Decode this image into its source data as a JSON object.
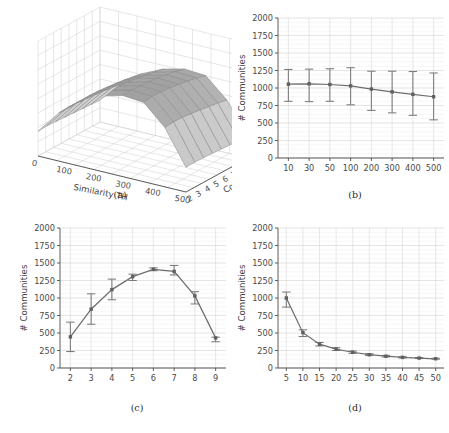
{
  "figure": {
    "background": "#ffffff",
    "line_color": "#6e6e6e",
    "grid_color": "#d9d9d9",
    "captions": {
      "a": "(a)",
      "b": "(b)",
      "c": "(c)",
      "d": "(d)"
    }
  },
  "chart_data": [
    {
      "id": "a",
      "type": "surface",
      "title": "",
      "caption": "(a)",
      "xlabel": "Similarity TH",
      "ylabel": "Content TH",
      "zlabel": "",
      "xticks": [
        0,
        100,
        200,
        300,
        400,
        500
      ],
      "yticks": [
        2,
        3,
        4,
        5,
        6,
        7,
        8,
        9
      ],
      "zticks": [
        0,
        250,
        500,
        750,
        1000,
        1250,
        1500,
        1750,
        2000
      ],
      "xlim": [
        0,
        500
      ],
      "ylim": [
        2,
        9
      ],
      "zlim": [
        0,
        2000
      ],
      "grid": true,
      "colormap": "greys",
      "z_matrix": [
        [
          430,
          440,
          430,
          420,
          410,
          400,
          390,
          380
        ],
        [
          840,
          850,
          845,
          830,
          815,
          800,
          780,
          760
        ],
        [
          1120,
          1140,
          1135,
          1120,
          1100,
          1080,
          1050,
          1020
        ],
        [
          1310,
          1330,
          1320,
          1300,
          1280,
          1250,
          1220,
          1190
        ],
        [
          1410,
          1420,
          1415,
          1400,
          1380,
          1350,
          1320,
          1280
        ],
        [
          1380,
          1400,
          1395,
          1380,
          1355,
          1330,
          1295,
          1255
        ],
        [
          1030,
          1045,
          1040,
          1020,
          1000,
          975,
          950,
          920
        ],
        [
          430,
          435,
          430,
          420,
          410,
          400,
          390,
          380
        ]
      ]
    },
    {
      "id": "b",
      "type": "line",
      "caption": "(b)",
      "xlabel": "",
      "ylabel": "# Communities",
      "categories": [
        "10",
        "30",
        "50",
        "100",
        "200",
        "300",
        "400",
        "500"
      ],
      "values": [
        1055,
        1060,
        1050,
        1030,
        985,
        945,
        910,
        875
      ],
      "err_low": [
        810,
        805,
        810,
        760,
        680,
        645,
        610,
        545
      ],
      "err_high": [
        1265,
        1270,
        1275,
        1290,
        1240,
        1240,
        1235,
        1215
      ],
      "yticks": [
        0,
        250,
        500,
        750,
        1000,
        1250,
        1500,
        1750,
        2000
      ],
      "ylim": [
        0,
        2000
      ],
      "grid": true
    },
    {
      "id": "c",
      "type": "line",
      "caption": "(c)",
      "xlabel": "",
      "ylabel": "# Communities",
      "categories": [
        "2",
        "3",
        "4",
        "5",
        "6",
        "7",
        "8",
        "9"
      ],
      "values": [
        445,
        840,
        1120,
        1305,
        1410,
        1380,
        1030,
        430
      ],
      "err_low": [
        235,
        625,
        975,
        1250,
        1390,
        1330,
        915,
        375
      ],
      "err_high": [
        655,
        1060,
        1270,
        1340,
        1430,
        1465,
        1090,
        440
      ],
      "yticks": [
        0,
        250,
        500,
        750,
        1000,
        1250,
        1500,
        1750,
        2000
      ],
      "ylim": [
        0,
        2000
      ],
      "grid": true
    },
    {
      "id": "d",
      "type": "line",
      "caption": "(d)",
      "xlabel": "",
      "ylabel": "# Communities",
      "categories": [
        "5",
        "10",
        "15",
        "20",
        "25",
        "30",
        "35",
        "40",
        "45",
        "50"
      ],
      "values": [
        1000,
        505,
        340,
        270,
        225,
        190,
        168,
        152,
        142,
        132
      ],
      "err_low": [
        870,
        450,
        315,
        250,
        210,
        178,
        158,
        144,
        136,
        126
      ],
      "err_high": [
        1085,
        545,
        365,
        290,
        242,
        204,
        180,
        162,
        150,
        140
      ],
      "yticks": [
        0,
        250,
        500,
        750,
        1000,
        1250,
        1500,
        1750,
        2000
      ],
      "ylim": [
        0,
        2000
      ],
      "grid": true
    }
  ]
}
